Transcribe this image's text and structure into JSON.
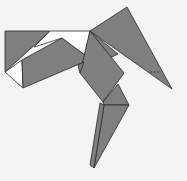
{
  "figure": {
    "background": "#f4f4f2",
    "fill": "#7f7f7f",
    "stroke": "#2a2a2a",
    "gap_fill": "#ffffff"
  },
  "pieces": [
    {
      "name": "left-triangle",
      "points": "5,31 50,31 5,72"
    },
    {
      "name": "left-white-triangle",
      "points": "5,72 22,60 23,88"
    },
    {
      "name": "body-parallelogram",
      "points": "22,60 62,38 85,55 84,62 23,88"
    },
    {
      "name": "top-white-gap",
      "points": "50,31 90,31 85,55 62,38 34,47"
    },
    {
      "name": "wing-large-triangle",
      "points": "90,31 127,7 172,89"
    },
    {
      "name": "neck-small",
      "points": "90,31 118,54 110,58"
    },
    {
      "name": "center-square",
      "points": "90,31 124,73 103,102 80,73"
    },
    {
      "name": "center-left-flap",
      "points": "84,62 80,73 78,65"
    },
    {
      "name": "leg-quad",
      "points": "103,102 118,84 129,105 104,105"
    },
    {
      "name": "leg-right",
      "points": "104,105 129,105 94,168"
    },
    {
      "name": "leg-left",
      "points": "100,103 104,105 94,168 90,165"
    }
  ],
  "annotations": [
    {
      "name": "dashed-mark",
      "x1": 150,
      "y1": 72,
      "x2": 160,
      "y2": 72
    }
  ]
}
